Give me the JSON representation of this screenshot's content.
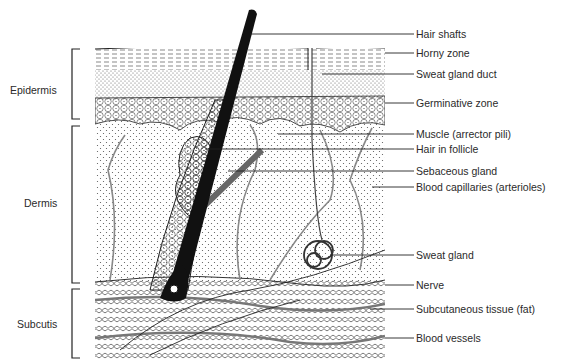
{
  "figure": {
    "type": "anatomical cross-section of skin",
    "regions": [
      {
        "label": "Epidermis",
        "top": 49,
        "bottom": 119
      },
      {
        "label": "Dermis",
        "top": 126,
        "bottom": 283
      },
      {
        "label": "Subcutis",
        "top": 289,
        "bottom": 358
      }
    ],
    "labels": [
      {
        "text": "Hair shafts",
        "y": 34
      },
      {
        "text": "Horny zone",
        "y": 53
      },
      {
        "text": "Sweat gland duct",
        "y": 74
      },
      {
        "text": "Germinative zone",
        "y": 103
      },
      {
        "text": "Muscle (arrector pili)",
        "y": 134
      },
      {
        "text": "Hair in follicle",
        "y": 149
      },
      {
        "text": "Sebaceous gland",
        "y": 171
      },
      {
        "text": "Blood capillaries (arterioles)",
        "y": 187
      },
      {
        "text": "Sweat gland",
        "y": 255
      },
      {
        "text": "Nerve",
        "y": 285
      },
      {
        "text": "Subcutaneous tissue (fat)",
        "y": 309
      },
      {
        "text": "Blood vessels",
        "y": 338
      }
    ]
  }
}
